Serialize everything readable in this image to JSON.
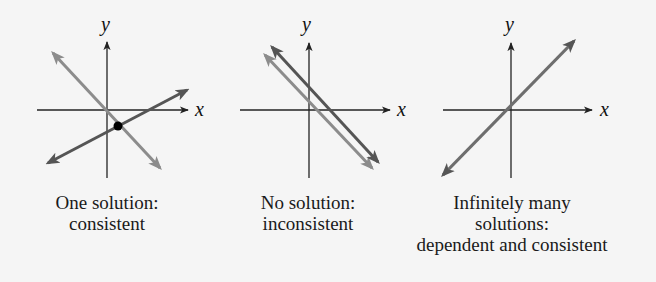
{
  "colors": {
    "background": "#f5f5f5",
    "axis": "#222222",
    "line_dark": "#555555",
    "line_light": "#8c8c8c",
    "point": "#000000",
    "text": "#1a1a1a"
  },
  "panels": [
    {
      "id": "one-solution",
      "axis_labels": {
        "x": "x",
        "y": "y"
      },
      "caption_lines": [
        "One solution:",
        "consistent"
      ]
    },
    {
      "id": "no-solution",
      "axis_labels": {
        "x": "x",
        "y": "y"
      },
      "caption_lines": [
        "No solution:",
        "inconsistent"
      ]
    },
    {
      "id": "infinitely-many",
      "axis_labels": {
        "x": "x",
        "y": "y"
      },
      "caption_lines": [
        "Infinitely many",
        "solutions:",
        "dependent and consistent"
      ]
    }
  ]
}
